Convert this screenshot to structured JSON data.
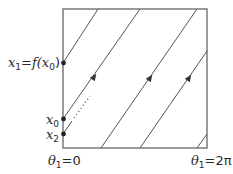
{
  "diagram": {
    "type": "phase-torus-map",
    "colors": {
      "line": "#555555",
      "box": "#666666",
      "dot": "#222222",
      "text": "#2a2a2a"
    },
    "labels": {
      "x1": {
        "var": "x",
        "sub": "1",
        "eq": "=",
        "f": "f(",
        "x0var": "x",
        "x0sub": "0",
        "close": ")"
      },
      "x0": {
        "var": "x",
        "sub": "0"
      },
      "x2": {
        "var": "x",
        "sub": "2"
      },
      "theta_left": {
        "var": "θ",
        "sub": "1",
        "rest": "=0"
      },
      "theta_right": {
        "var": "θ",
        "sub": "1",
        "rest": "=2π"
      }
    },
    "box": {
      "x": 63,
      "y": 9,
      "w": 144,
      "h": 139
    },
    "trajectories": [
      {
        "name": "trajectory-a",
        "from": [
          63,
          63
        ],
        "to": [
          98,
          9
        ],
        "arrow": null
      },
      {
        "name": "trajectory-b",
        "from": [
          63,
          119
        ],
        "to": [
          140,
          9
        ],
        "arrow": [
          94,
          77
        ]
      },
      {
        "name": "trajectory-c",
        "from": [
          101,
          148
        ],
        "to": [
          197,
          9
        ],
        "arrow": [
          150,
          78
        ]
      },
      {
        "name": "trajectory-d",
        "from": [
          140,
          148
        ],
        "to": [
          207,
          51
        ],
        "arrow": [
          189,
          78
        ]
      },
      {
        "name": "trajectory-e",
        "from": [
          197,
          148
        ],
        "to": [
          207,
          134
        ],
        "arrow": null
      }
    ],
    "points": [
      {
        "name": "point-x1",
        "at": [
          63,
          63
        ]
      },
      {
        "name": "point-x0",
        "at": [
          63,
          119
        ]
      },
      {
        "name": "point-x2",
        "at": [
          63,
          134
        ]
      }
    ]
  }
}
